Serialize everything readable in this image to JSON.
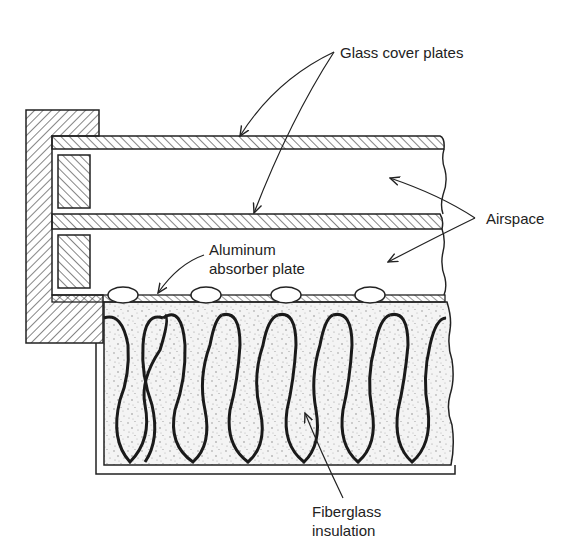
{
  "figure": {
    "type": "cross-section diagram"
  },
  "labels": {
    "glass_cover_plates": "Glass cover plates",
    "airspace": "Airspace",
    "absorber_line1": "Aluminum",
    "absorber_line2": "absorber plate",
    "fiberglass_line1": "Fiberglass",
    "fiberglass_line2": "insulation"
  },
  "components": [
    {
      "name": "Frame",
      "pattern": "hatched"
    },
    {
      "name": "Glass cover plate (upper)",
      "pattern": "hatched"
    },
    {
      "name": "Glass cover plate (lower)",
      "pattern": "hatched"
    },
    {
      "name": "Spacer blocks",
      "count": 2,
      "pattern": "hatched"
    },
    {
      "name": "Airspace",
      "count": 2
    },
    {
      "name": "Aluminum absorber plate",
      "tubes": 4
    },
    {
      "name": "Fiberglass insulation",
      "pattern": "stippled"
    }
  ],
  "colors": {
    "ink": "#222222",
    "background": "#ffffff",
    "stipple": "#bdbdbd"
  }
}
